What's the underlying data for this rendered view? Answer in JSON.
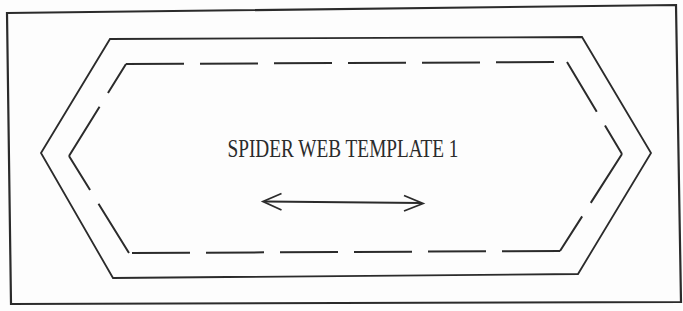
{
  "diagram": {
    "title": "SPIDER WEB TEMPLATE 1",
    "colors": {
      "line": "#2b2b2b",
      "paper": "#fdfdfd"
    },
    "icons": {
      "double_arrow": "left-right-double-headed-arrow"
    },
    "line_styles": {
      "outline": "solid",
      "inner_hexagon": "dashed"
    }
  }
}
